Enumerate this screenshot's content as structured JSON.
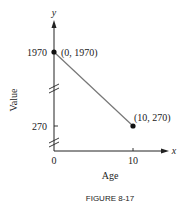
{
  "chart_data": {
    "type": "line",
    "title": "",
    "caption": "FIGURE 8-17",
    "xlabel": "Age",
    "ylabel": "Value",
    "x_axis_symbol": "x",
    "y_axis_symbol": "y",
    "x_ticks": [
      "0",
      "10"
    ],
    "y_ticks": [
      "270",
      "1970"
    ],
    "y_axis_breaks": 2,
    "grid": false,
    "series": [
      {
        "name": "value",
        "points": [
          {
            "x": 0,
            "y": 1970,
            "label": "(0, 1970)"
          },
          {
            "x": 10,
            "y": 270,
            "label": "(10, 270)"
          }
        ]
      }
    ],
    "line_color": "#777777"
  }
}
